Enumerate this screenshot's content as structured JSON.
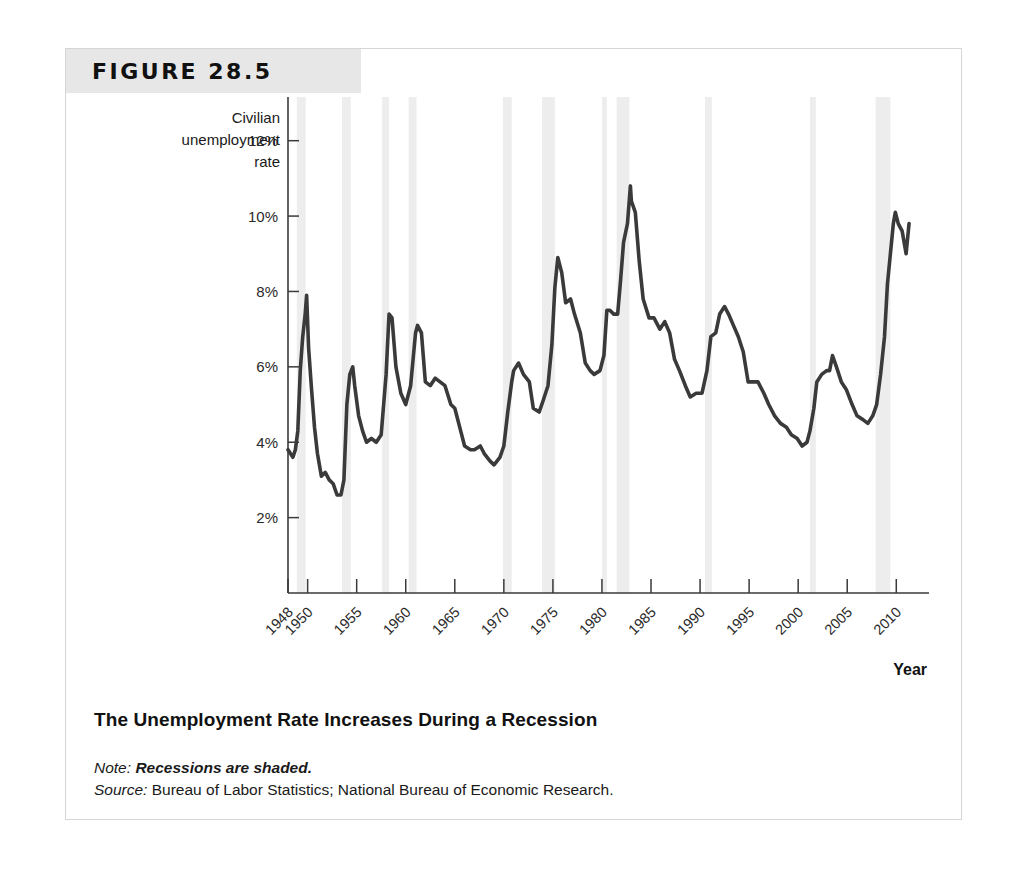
{
  "figure": {
    "number_label": "FIGURE 28.5",
    "caption": "The Unemployment Rate Increases During a Recession",
    "note_keyword": "Note:",
    "note_text": "Recessions are shaded.",
    "source_keyword": "Source:",
    "source_text": "Bureau of Labor Statistics; National Bureau of Economic Research.",
    "banner_color": "#e7e7e7",
    "line_color": "#3a3a3a",
    "shade_color": "#ededed"
  },
  "chart_data": {
    "type": "line",
    "title": "The Unemployment Rate Increases During a Recession",
    "ylabel": "Civilian unemployment rate",
    "xlabel": "Year",
    "ylim": [
      0,
      13
    ],
    "xlim": [
      1948,
      2011.5
    ],
    "grid": false,
    "legend": null,
    "ytick_labels": [
      "12%",
      "10%",
      "8%",
      "6%",
      "4%",
      "2%"
    ],
    "ytick_values": [
      12,
      10,
      8,
      6,
      4,
      2
    ],
    "xtick_labels": [
      "1948",
      "1950",
      "1955",
      "1960",
      "1965",
      "1970",
      "1975",
      "1980",
      "1985",
      "1990",
      "1995",
      "2000",
      "2005",
      "2010"
    ],
    "xtick_values": [
      1948,
      1950,
      1955,
      1960,
      1965,
      1970,
      1975,
      1980,
      1985,
      1990,
      1995,
      2000,
      2005,
      2010
    ],
    "series": [
      {
        "name": "Civilian unemployment rate",
        "units": "percent",
        "x": [
          1948.0,
          1948.25,
          1948.5,
          1948.75,
          1949.0,
          1949.25,
          1949.5,
          1949.75,
          1949.9,
          1950.1,
          1950.4,
          1950.7,
          1951.0,
          1951.4,
          1951.8,
          1952.2,
          1952.6,
          1953.0,
          1953.4,
          1953.7,
          1954.0,
          1954.3,
          1954.6,
          1954.8,
          1955.2,
          1955.6,
          1956.0,
          1956.5,
          1957.0,
          1957.5,
          1958.0,
          1958.3,
          1958.6,
          1959.0,
          1959.5,
          1960.0,
          1960.5,
          1961.0,
          1961.2,
          1961.6,
          1962.0,
          1962.5,
          1963.0,
          1963.5,
          1964.0,
          1964.6,
          1965.0,
          1965.6,
          1966.0,
          1966.6,
          1967.0,
          1967.6,
          1968.0,
          1968.6,
          1969.0,
          1969.6,
          1970.0,
          1970.4,
          1970.8,
          1971.0,
          1971.5,
          1972.0,
          1972.6,
          1973.0,
          1973.6,
          1974.0,
          1974.5,
          1974.9,
          1975.2,
          1975.5,
          1975.9,
          1976.3,
          1976.8,
          1977.2,
          1977.8,
          1978.3,
          1978.8,
          1979.2,
          1979.8,
          1980.2,
          1980.5,
          1980.8,
          1981.2,
          1981.6,
          1981.9,
          1982.2,
          1982.6,
          1982.9,
          1983.0,
          1983.4,
          1983.8,
          1984.2,
          1984.8,
          1985.3,
          1985.9,
          1986.4,
          1986.9,
          1987.4,
          1987.9,
          1988.5,
          1989.0,
          1989.6,
          1990.2,
          1990.7,
          1991.1,
          1991.6,
          1992.0,
          1992.5,
          1992.9,
          1993.4,
          1993.9,
          1994.4,
          1994.9,
          1995.4,
          1995.9,
          1996.5,
          1997.0,
          1997.6,
          1998.2,
          1998.8,
          1999.3,
          1999.9,
          2000.4,
          2000.9,
          2001.2,
          2001.6,
          2001.9,
          2002.4,
          2002.9,
          2003.2,
          2003.5,
          2003.9,
          2004.4,
          2004.9,
          2005.5,
          2006.0,
          2006.6,
          2007.1,
          2007.6,
          2008.0,
          2008.4,
          2008.8,
          2009.1,
          2009.4,
          2009.7,
          2009.9,
          2010.2,
          2010.6,
          2011.0,
          2011.3
        ],
        "y": [
          3.8,
          3.7,
          3.6,
          3.8,
          4.3,
          5.9,
          6.8,
          7.4,
          7.9,
          6.5,
          5.4,
          4.4,
          3.7,
          3.1,
          3.2,
          3.0,
          2.9,
          2.6,
          2.6,
          3.0,
          5.0,
          5.8,
          6.0,
          5.5,
          4.7,
          4.3,
          4.0,
          4.1,
          4.0,
          4.2,
          5.8,
          7.4,
          7.3,
          6.0,
          5.3,
          5.0,
          5.5,
          6.9,
          7.1,
          6.9,
          5.6,
          5.5,
          5.7,
          5.6,
          5.5,
          5.0,
          4.9,
          4.3,
          3.9,
          3.8,
          3.8,
          3.9,
          3.7,
          3.5,
          3.4,
          3.6,
          3.9,
          4.8,
          5.6,
          5.9,
          6.1,
          5.8,
          5.6,
          4.9,
          4.8,
          5.1,
          5.5,
          6.6,
          8.1,
          8.9,
          8.5,
          7.7,
          7.8,
          7.4,
          6.9,
          6.1,
          5.9,
          5.8,
          5.9,
          6.3,
          7.5,
          7.5,
          7.4,
          7.4,
          8.3,
          9.3,
          9.8,
          10.8,
          10.4,
          10.1,
          8.8,
          7.8,
          7.3,
          7.3,
          7.0,
          7.2,
          6.9,
          6.2,
          5.9,
          5.5,
          5.2,
          5.3,
          5.3,
          5.9,
          6.8,
          6.9,
          7.4,
          7.6,
          7.4,
          7.1,
          6.8,
          6.4,
          5.6,
          5.6,
          5.6,
          5.3,
          5.0,
          4.7,
          4.5,
          4.4,
          4.2,
          4.1,
          3.9,
          4.0,
          4.3,
          4.9,
          5.6,
          5.8,
          5.9,
          5.9,
          6.3,
          6.0,
          5.6,
          5.4,
          5.0,
          4.7,
          4.6,
          4.5,
          4.7,
          5.0,
          5.8,
          6.8,
          8.2,
          9.0,
          9.8,
          10.1,
          9.8,
          9.6,
          9.0,
          9.8
        ]
      }
    ],
    "shaded_regions": {
      "label": "Recessions are shaded.",
      "color": "#ededed",
      "spans": [
        {
          "start": 1948.9,
          "end": 1949.8
        },
        {
          "start": 1953.5,
          "end": 1954.4
        },
        {
          "start": 1957.6,
          "end": 1958.3
        },
        {
          "start": 1960.3,
          "end": 1961.1
        },
        {
          "start": 1969.9,
          "end": 1970.8
        },
        {
          "start": 1973.9,
          "end": 1975.2
        },
        {
          "start": 1980.0,
          "end": 1980.5
        },
        {
          "start": 1981.5,
          "end": 1982.8
        },
        {
          "start": 1990.5,
          "end": 1991.2
        },
        {
          "start": 2001.2,
          "end": 2001.8
        },
        {
          "start": 2007.9,
          "end": 2009.4
        }
      ]
    }
  }
}
